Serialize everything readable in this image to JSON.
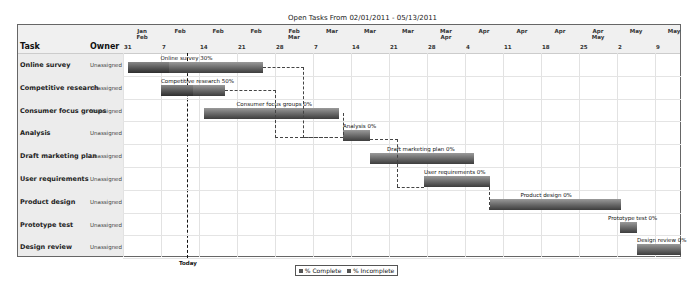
{
  "chart_data": {
    "type": "gantt",
    "title": "Open Tasks From 02/01/2011 - 05/13/2011",
    "columns": {
      "task": "Task",
      "owner": "Owner"
    },
    "timeline": {
      "weeks": [
        {
          "month": "Jan\nFeb",
          "day": "31"
        },
        {
          "month": "Feb",
          "day": "7"
        },
        {
          "month": "Feb",
          "day": "14"
        },
        {
          "month": "Feb",
          "day": "21"
        },
        {
          "month": "Feb\nMar",
          "day": "28"
        },
        {
          "month": "Mar",
          "day": "7"
        },
        {
          "month": "Mar",
          "day": "14"
        },
        {
          "month": "Mar",
          "day": "21"
        },
        {
          "month": "Mar\nApr",
          "day": "28"
        },
        {
          "month": "Apr",
          "day": "4"
        },
        {
          "month": "Apr",
          "day": "11"
        },
        {
          "month": "Apr",
          "day": "18"
        },
        {
          "month": "Apr\nMay",
          "day": "25"
        },
        {
          "month": "May",
          "day": "2"
        },
        {
          "month": "May",
          "day": "9"
        }
      ]
    },
    "tasks": [
      {
        "name": "Online survey",
        "owner": "Unassigned",
        "label": "Online survey 30%",
        "complete": 30,
        "x0": 110,
        "x1": 245
      },
      {
        "name": "Competitive research",
        "owner": "Unassigned",
        "label": "Competitive research 50%",
        "complete": 50,
        "x0": 143,
        "x1": 207
      },
      {
        "name": "Consumer focus groups",
        "owner": "Unassigned",
        "label": "Consumer focus groups 0%",
        "complete": 0,
        "x0": 186,
        "x1": 321
      },
      {
        "name": "Analysis",
        "owner": "Unassigned",
        "label": "Analysis 0%",
        "complete": 0,
        "x0": 325,
        "x1": 352
      },
      {
        "name": "Draft marketing plan",
        "owner": "Unassigned",
        "label": "Draft marketing plan 0%",
        "complete": 0,
        "x0": 352,
        "x1": 456
      },
      {
        "name": "User requirements",
        "owner": "Unassigned",
        "label": "User requirements 0%",
        "complete": 0,
        "x0": 406,
        "x1": 472
      },
      {
        "name": "Product design",
        "owner": "Unassigned",
        "label": "Product design 0%",
        "complete": 0,
        "x0": 472,
        "x1": 603
      },
      {
        "name": "Prototype test",
        "owner": "Unassigned",
        "label": "Prototype test 0%",
        "complete": 0,
        "x0": 602,
        "x1": 619
      },
      {
        "name": "Design review",
        "owner": "Unassigned",
        "label": "Design review 0%",
        "complete": 0,
        "x0": 619,
        "x1": 663
      }
    ],
    "today_label": "Today",
    "legend": [
      "% Complete",
      "% Incomplete"
    ]
  }
}
